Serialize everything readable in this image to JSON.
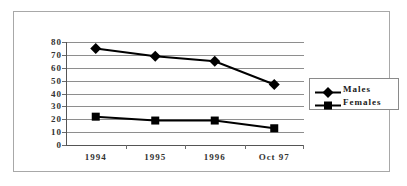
{
  "chart_data": {
    "type": "line",
    "title": "",
    "subtitle": "",
    "xlabel": "",
    "ylabel": "",
    "categories": [
      "1994",
      "1995",
      "1996",
      "Oct 97"
    ],
    "series": [
      {
        "name": "Males",
        "marker": "diamond",
        "color": "#000000",
        "values": [
          75,
          69,
          65,
          47
        ]
      },
      {
        "name": "Females",
        "marker": "square",
        "color": "#000000",
        "values": [
          22,
          19,
          19,
          13
        ]
      }
    ],
    "ylim": [
      0,
      80
    ],
    "ytick_step": 10,
    "yticks": [
      "80",
      "70",
      "60",
      "50",
      "40",
      "30",
      "20",
      "10",
      "0"
    ],
    "grid": true,
    "legend_position": "right"
  },
  "legend": {
    "entries": [
      {
        "label": "Males",
        "marker": "diamond-marker"
      },
      {
        "label": "Females",
        "marker": "square-marker"
      }
    ]
  },
  "colors": {
    "series": "#000000",
    "gridline": "#8e8e8e",
    "axis": "#555555",
    "frame": "#a8a8a8",
    "text": "#333333",
    "background": "#ffffff"
  }
}
